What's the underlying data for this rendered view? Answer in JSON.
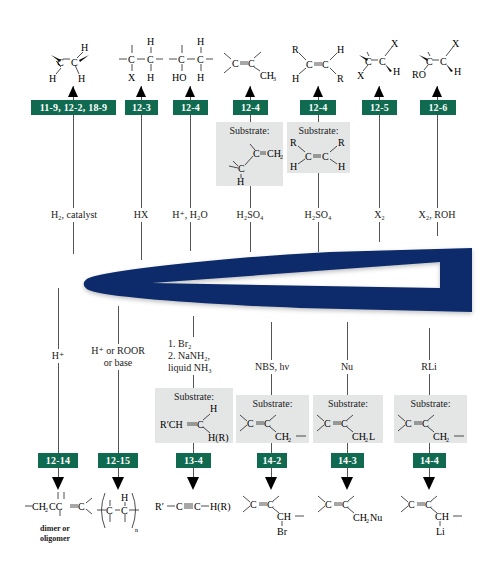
{
  "diagram": {
    "center_shape": {
      "description": "dark blue tapered arrowhead shape with hollow center",
      "color": "#0a2a6b"
    },
    "badge_color": "#0f6a4f",
    "substrate_box_color": "#e4e6e6",
    "top_reactions": [
      {
        "section": "11-9, 12-2, 18-9",
        "reagent": "H₂, catalyst",
        "product": "H–C–C–H (syn addition of H₂)"
      },
      {
        "section": "12-3",
        "reagent": "HX",
        "product": "–C(X)–C(H)–"
      },
      {
        "section": "12-4",
        "reagent": "H⁺, H₂O",
        "product": "–C(HO)–C(H)–"
      },
      {
        "section": "12-4",
        "reagent": "H₂SO₄",
        "substrate_label": "Substrate:",
        "substrate": "H–C–C(=CH₂)",
        "product": ">C=C(CH₃)"
      },
      {
        "section": "12-4",
        "reagent": "H₂SO₄",
        "substrate_label": "Substrate:",
        "substrate": "RHC=CHR",
        "product": "RHC=CHR (trans)"
      },
      {
        "section": "12-5",
        "reagent": "X₂",
        "product": "X–C–C–X (anti)"
      },
      {
        "section": "12-6",
        "reagent": "X₂, ROH",
        "product": "RO–C–C–X (anti)"
      }
    ],
    "bottom_reactions": [
      {
        "section": "12-14",
        "reagent": "H⁺",
        "product": "–CH₂CC=C<",
        "product_note": "dimer or oligomer"
      },
      {
        "section": "12-15",
        "reagent": "H⁺ or ROOR or base",
        "product": "(–C–C(H)–)n"
      },
      {
        "section": "13-4",
        "reagent": "1. Br₂ 2. NaNH₂, liquid NH₃",
        "substrate_label": "Substrate:",
        "substrate": "R′CH=C(H)H(R)",
        "product": "R′–C≡C–H(R)"
      },
      {
        "section": "14-2",
        "reagent": "NBS, hν",
        "substrate_label": "Substrate:",
        "substrate": ">C=C–CH₂–",
        "product": ">C=C–CH(Br)–"
      },
      {
        "section": "14-3",
        "reagent": "Nu",
        "substrate_label": "Substrate:",
        "substrate": ">C=C–CH₂L",
        "product": ">C=C–CH₂Nu"
      },
      {
        "section": "14-4",
        "reagent": "RLi",
        "substrate_label": "Substrate:",
        "substrate": ">C=C–CH₂–",
        "product": ">C=C–CH(Li)–"
      }
    ],
    "labels": {
      "t0_reagent": "H₂, catalyst",
      "t1_reagent": "HX",
      "t2_reagent": "H⁺, H₂O",
      "t3_reagent": "H₂SO₄",
      "t4_reagent": "H₂SO₄",
      "t5_reagent": "X₂",
      "t6_reagent": "X₂, ROH",
      "t0_badge": "11-9, 12-2, 18-9",
      "t1_badge": "12-3",
      "t2_badge": "12-4",
      "t3_badge": "12-4",
      "t4_badge": "12-4",
      "t5_badge": "12-5",
      "t6_badge": "12-6",
      "substrate": "Substrate:",
      "b0_reagent": "H⁺",
      "b1_reagent_l1": "H⁺ or ROOR",
      "b1_reagent_l2": "or base",
      "b2_reagent_l1": "1. Br₂",
      "b2_reagent_l2": "2. NaNH₂,",
      "b2_reagent_l3": "liquid NH₃",
      "b3_reagent": "NBS, hν",
      "b4_reagent": "Nu",
      "b5_reagent": "RLi",
      "b0_badge": "12-14",
      "b1_badge": "12-15",
      "b2_badge": "13-4",
      "b3_badge": "14-2",
      "b4_badge": "14-3",
      "b5_badge": "14-4",
      "b0_note_l1": "dimer or",
      "b0_note_l2": "oligomer"
    }
  }
}
